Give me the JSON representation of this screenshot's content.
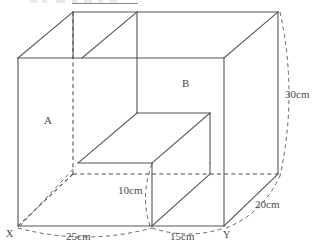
{
  "figure": {
    "kind": "3d-solid-diagram",
    "stroke_color": "#555555",
    "hidden_stroke_color": "#4d4d4d",
    "background_color": "#ffffff"
  },
  "labels": {
    "face_a": "A",
    "face_b": "B",
    "vertex_x": "X",
    "vertex_y": "Y"
  },
  "dimensions": {
    "bottom_left": "25cm",
    "bottom_right": "15cm",
    "notch_height": "10cm",
    "depth": "20cm",
    "height": "30cm"
  },
  "label_positions": {
    "face_a": {
      "x": 44,
      "y": 121
    },
    "face_b": {
      "x": 182,
      "y": 84
    },
    "vertex_x": {
      "x": 7,
      "y": 227
    },
    "vertex_y": {
      "x": 224,
      "y": 228
    },
    "bottom_left": {
      "x": 68,
      "y": 232
    },
    "bottom_right": {
      "x": 172,
      "y": 232
    },
    "notch_height": {
      "x": 121,
      "y": 188
    },
    "depth": {
      "x": 258,
      "y": 202
    },
    "height": {
      "x": 287,
      "y": 93
    }
  },
  "geometry": {
    "front_bottom_left": {
      "x": 18,
      "y": 226
    },
    "front_bottom_mid": {
      "x": 152,
      "y": 226
    },
    "front_bottom_right": {
      "x": 224,
      "y": 226
    },
    "front_top_left": {
      "x": 18,
      "y": 58
    },
    "front_top_right": {
      "x": 224,
      "y": 58
    },
    "back_top_left": {
      "x": 73,
      "y": 12
    },
    "back_top_right": {
      "x": 278,
      "y": 12
    },
    "back_bottom_left": {
      "x": 73,
      "y": 174
    },
    "back_bottom_right": {
      "x": 278,
      "y": 174
    },
    "notch_inner_left": {
      "x": 78,
      "y": 163
    },
    "notch_inner_top_left": {
      "x": 137,
      "y": 113
    },
    "notch_inner_top_right": {
      "x": 210,
      "y": 113
    },
    "notch_inner_bottom_right": {
      "x": 152,
      "y": 173
    }
  }
}
